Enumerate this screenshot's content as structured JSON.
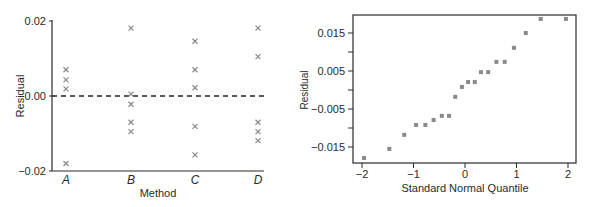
{
  "chart_data": [
    {
      "type": "scatter",
      "title": "",
      "xlabel": "Method",
      "ylabel": "Residual",
      "categories": [
        "A",
        "B",
        "C",
        "D"
      ],
      "yticks": [
        "0.02",
        "0.00",
        "−0.02"
      ],
      "ytick_values": [
        0.02,
        0.0,
        -0.02
      ],
      "ylim": [
        -0.02,
        0.02
      ],
      "reference_line": {
        "y": 0.0,
        "style": "dashed"
      },
      "marker": "x",
      "grid": false,
      "series": [
        {
          "name": "A",
          "values": [
            0.007,
            0.0043,
            0.0019,
            -0.018
          ]
        },
        {
          "name": "B",
          "values": [
            0.0181,
            0.0005,
            -0.0022,
            -0.007,
            -0.0095
          ]
        },
        {
          "name": "C",
          "values": [
            0.0146,
            0.007,
            0.0022,
            -0.0081,
            -0.0157
          ]
        },
        {
          "name": "D",
          "values": [
            0.0181,
            0.0105,
            -0.007,
            -0.0095,
            -0.0119
          ]
        }
      ]
    },
    {
      "type": "scatter",
      "title": "",
      "xlabel": "Standard Normal Quantile",
      "ylabel": "Residual",
      "xticks": [
        "−2",
        "−1",
        "0",
        "1",
        "2"
      ],
      "xtick_values": [
        -2,
        -1,
        0,
        1,
        2
      ],
      "yticks": [
        "0.015",
        "0.005",
        "−0.005",
        "−0.015"
      ],
      "ytick_values": [
        0.015,
        0.005,
        -0.005,
        -0.015
      ],
      "minor_yticks": [
        0.01,
        0.0,
        -0.01
      ],
      "xlim": [
        -2.1,
        2.1
      ],
      "ylim": [
        -0.0195,
        0.0197
      ],
      "marker": "square",
      "grid": false,
      "x": [
        -1.96,
        -1.47,
        -1.18,
        -0.95,
        -0.77,
        -0.61,
        -0.45,
        -0.31,
        -0.19,
        -0.06,
        0.06,
        0.19,
        0.31,
        0.45,
        0.61,
        0.77,
        0.95,
        1.18,
        1.47,
        1.96
      ],
      "y": [
        -0.0179,
        -0.0155,
        -0.0118,
        -0.0092,
        -0.0092,
        -0.0079,
        -0.0068,
        -0.0068,
        -0.0018,
        0.0008,
        0.0021,
        0.0021,
        0.0047,
        0.0047,
        0.0074,
        0.0074,
        0.0111,
        0.015,
        0.0187,
        0.0187
      ]
    }
  ],
  "colors": {
    "axis": "#2a2a2a",
    "marker": "#8a8a8a",
    "background": "#ffffff"
  }
}
